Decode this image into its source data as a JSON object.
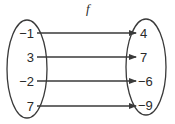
{
  "diagram": {
    "type": "function-mapping",
    "title": "f",
    "domain": [
      "−1",
      "3",
      "−2",
      "7"
    ],
    "range": [
      "4",
      "7",
      "−6",
      "−9"
    ],
    "mappings": [
      {
        "from": "−1",
        "to": "4"
      },
      {
        "from": "3",
        "to": "7"
      },
      {
        "from": "−2",
        "to": "−6"
      },
      {
        "from": "7",
        "to": "−9"
      }
    ],
    "colors": {
      "stroke": "#3a3a3a",
      "text": "#2a2a2a",
      "background": "#ffffff"
    }
  }
}
